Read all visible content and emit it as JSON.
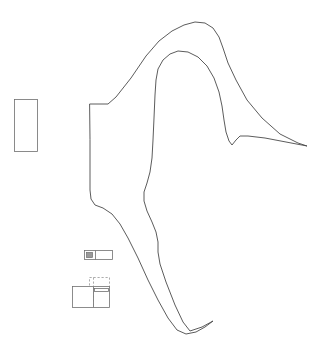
{
  "document": {
    "title": "Untitled Line Drawing",
    "background_color": "#ffffff",
    "line_color": "#4a4a4a",
    "detail_line_color": "#707070",
    "swatch_fill_color": "#9a9a9a",
    "width": 324,
    "height": 362
  },
  "shapes": {
    "main_outline": {
      "name": "main-outline",
      "description": "Large irregular closed polyline forming a bird-like / site-boundary profile",
      "path": "M 90 104 L 108 104 L 116 97 L 131 78 L 146 56 L 159 41 L 172 31 L 184 25 L 195 22 L 205 23 L 213 28 L 219 37 L 223 48 L 228 63 L 236 80 L 247 100 L 262 118 L 280 134 L 298 143 L 307 146 L 286 142 L 265 138 L 248 136 L 240 136 L 236 140 L 232 145 L 229 141 L 226 132 L 224 120 L 222 106 L 219 92 L 214 78 L 207 66 L 198 57 L 188 52 L 178 51 L 170 54 L 163 60 L 158 69 L 156 80 L 155 95 L 154 118 L 153 140 L 152 158 L 150 172 L 147 183 L 144 192 L 144 201 L 147 211 L 152 222 L 156 232 L 158 242 L 158 252 L 160 264 L 166 282 L 175 305 L 183 322 L 190 331 L 202 327 L 213 321 L 205 327 L 196 332 L 186 334 L 177 330 L 168 318 L 158 300 L 148 280 L 138 258 L 128 238 L 120 224 L 112 214 L 103 208 L 95 205 L 91 199 L 90 190 L 90 175 L 90 160 L 90 140 Z"
    },
    "left_rectangle": {
      "name": "left-rectangle",
      "description": "Detached vertical rectangle at left of drawing",
      "x": 14.5,
      "y": 99.5,
      "width": 23,
      "height": 52
    },
    "detail_bar": {
      "name": "detail-bar",
      "description": "Small horizontal bar with filled square swatch at its left end",
      "outer": {
        "x": 84.5,
        "y": 250.5,
        "width": 28,
        "height": 9
      },
      "swatch": {
        "x": 86.5,
        "y": 252.5,
        "width": 6,
        "height": 5
      },
      "divider_x": 95.5
    },
    "detail_blocks": {
      "name": "detail-blocks",
      "description": "Pair of overlapping small rectangles below the detail bar",
      "upper_block": {
        "x": 89.5,
        "y": 277.5,
        "width": 20,
        "height": 16
      },
      "lower_block": {
        "x": 72.5,
        "y": 286.5,
        "width": 21,
        "height": 21
      },
      "right_block": {
        "x": 93.5,
        "y": 286.5,
        "width": 16,
        "height": 21
      },
      "inner_bar": {
        "x": 94.5,
        "y": 288.5,
        "width": 14,
        "height": 3
      },
      "dashed_vertical_x": 93.5,
      "dashed_vertical_y1": 277.5,
      "dashed_vertical_y2": 307.5
    }
  },
  "layers": [
    {
      "label": "Outline",
      "visible": true
    },
    {
      "label": "Details",
      "visible": true
    }
  ]
}
